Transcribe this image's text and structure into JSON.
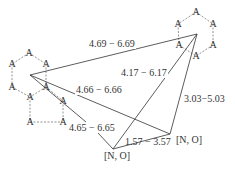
{
  "diagram": {
    "type": "pharmacophore-distance-map",
    "left_ring_atoms": [
      {
        "label": "A",
        "x": 29,
        "y": 53
      },
      {
        "label": "A",
        "x": 12,
        "y": 64
      },
      {
        "label": "A",
        "x": 46,
        "y": 64
      },
      {
        "label": "A",
        "x": 12,
        "y": 87
      },
      {
        "label": "A",
        "x": 46,
        "y": 87
      },
      {
        "label": "A",
        "x": 30,
        "y": 97
      },
      {
        "label": "A",
        "x": 63,
        "y": 101
      },
      {
        "label": "A",
        "x": 30,
        "y": 122
      },
      {
        "label": "A",
        "x": 63,
        "y": 122
      }
    ],
    "right_ring_atoms": [
      {
        "label": "A",
        "x": 196,
        "y": 12
      },
      {
        "label": "A",
        "x": 178,
        "y": 24
      },
      {
        "label": "A",
        "x": 213,
        "y": 24
      },
      {
        "label": "A",
        "x": 179,
        "y": 45
      },
      {
        "label": "A",
        "x": 213,
        "y": 45
      },
      {
        "label": "A",
        "x": 196,
        "y": 56
      }
    ],
    "features": {
      "no_lower": {
        "label": "[N, O]",
        "x": 117,
        "y": 156
      },
      "no_right": {
        "label": "[N, O]",
        "x": 187,
        "y": 141
      }
    },
    "distances": {
      "left_to_right_ring": "4.69 − 6.69",
      "right_ring_to_no_lower": "4.17 − 6.17",
      "left_ring_to_no_right": "4.66 − 6.66",
      "right_ring_to_no_right": "3.03−5.03",
      "left_ring_to_no_lower": "4.65 − 6.65",
      "no_lower_to_no_right": "1.57 − 3.57"
    }
  }
}
